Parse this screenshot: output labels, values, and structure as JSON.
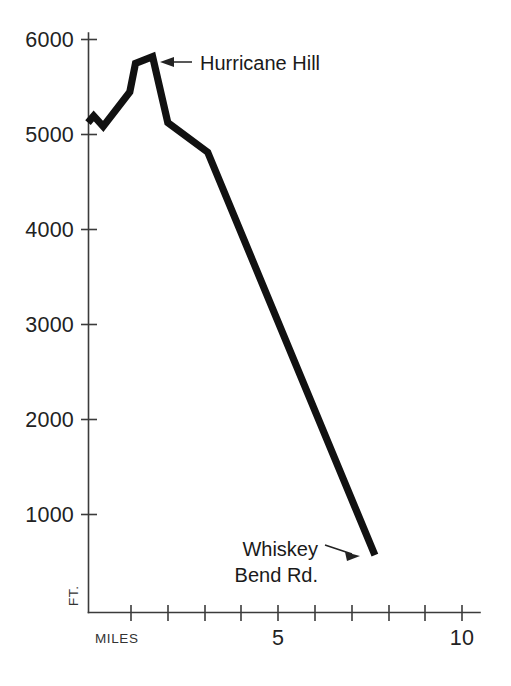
{
  "chart_data": {
    "type": "line",
    "title": "",
    "subtitle": "",
    "xlabel": "MILES",
    "ylabel": "FT.",
    "xlim": [
      0,
      10
    ],
    "ylim": [
      0,
      6000
    ],
    "grid": false,
    "legend": null,
    "x_tick_values": [
      1,
      2,
      3,
      4,
      5,
      6,
      7,
      8,
      9,
      10
    ],
    "x_tick_labels": [
      "",
      "",
      "",
      "",
      "5",
      "",
      "",
      "",
      "",
      "10"
    ],
    "y_tick_values": [
      1000,
      2000,
      3000,
      4000,
      5000,
      6000
    ],
    "y_tick_labels": [
      "1000",
      "2000",
      "3000",
      "4000",
      "5000",
      "6000"
    ],
    "series": [
      {
        "name": "Trail elevation profile",
        "x": [
          0.0,
          0.15,
          0.4,
          1.1,
          1.25,
          1.7,
          2.1,
          3.15,
          7.55
        ],
        "y": [
          5130,
          5200,
          5090,
          5450,
          5750,
          5820,
          5130,
          4820,
          600
        ]
      }
    ],
    "annotations": [
      {
        "id": "hurricane-hill",
        "label": "Hurricane Hill",
        "x": 1.7,
        "y": 5820,
        "text_lines": [
          "Hurricane Hill"
        ],
        "arrow_direction": "left"
      },
      {
        "id": "whiskey-bend-rd",
        "label": "Whiskey Bend Rd.",
        "x": 7.55,
        "y": 600,
        "text_lines": [
          "Whiskey",
          "Bend Rd."
        ],
        "arrow_direction": "right"
      }
    ],
    "colors": {
      "background": "#ffffff",
      "line": "#111111",
      "axis": "#3b3b3b",
      "text": "#222222"
    }
  },
  "axes": {
    "y_labels": [
      "6000",
      "5000",
      "4000",
      "3000",
      "2000",
      "1000"
    ],
    "x_labels": [
      "5",
      "10"
    ],
    "y_unit": "FT.",
    "x_unit": "MILES"
  },
  "annotations": {
    "hurricane_hill": "Hurricane Hill",
    "whiskey_bend_line1": "Whiskey",
    "whiskey_bend_line2": "Bend Rd."
  }
}
